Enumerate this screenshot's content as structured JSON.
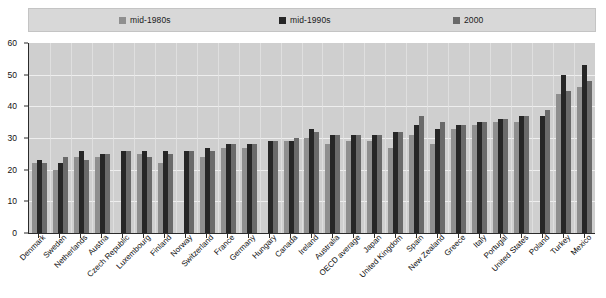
{
  "legend": {
    "items": [
      {
        "label": "mid-1980s",
        "color": "#8f8f8f",
        "icon": "square-swatch-icon"
      },
      {
        "label": "mid-1990s",
        "color": "#262626",
        "icon": "square-swatch-icon"
      },
      {
        "label": "2000",
        "color": "#6a6a6a",
        "icon": "square-swatch-icon"
      }
    ]
  },
  "chart_data": {
    "type": "bar",
    "title": "",
    "subtitle": "",
    "xlabel": "",
    "ylabel": "",
    "ylim": [
      0,
      60
    ],
    "yticks": [
      0,
      10,
      20,
      30,
      40,
      50,
      60
    ],
    "grid": true,
    "legend_position": "top",
    "categories": [
      "Denmark",
      "Sweden",
      "Netherlands",
      "Austria",
      "Czech Republic",
      "Luxembourg",
      "Finland",
      "Norway",
      "Switzerland",
      "France",
      "Germany",
      "Hungary",
      "Canada",
      "Ireland",
      "Australia",
      "OECD average",
      "Japan",
      "United Kingdom",
      "Spain",
      "New Zealand",
      "Greece",
      "Italy",
      "Portugal",
      "United States",
      "Poland",
      "Turkey",
      "Mexico"
    ],
    "series": [
      {
        "name": "mid-1980s",
        "color": "#8f8f8f",
        "values": [
          22,
          20,
          24,
          24,
          null,
          25,
          22,
          null,
          24,
          27,
          27,
          null,
          29,
          30,
          28,
          29,
          29,
          27,
          31,
          28,
          33,
          34,
          35,
          35,
          null,
          44,
          46
        ]
      },
      {
        "name": "mid-1990s",
        "color": "#262626",
        "values": [
          23,
          22,
          26,
          25,
          26,
          26,
          26,
          26,
          27,
          28,
          28,
          29,
          29,
          33,
          31,
          31,
          31,
          32,
          34,
          33,
          34,
          35,
          36,
          37,
          37,
          50,
          53
        ]
      },
      {
        "name": "2000",
        "color": "#6a6a6a",
        "values": [
          22,
          24,
          23,
          25,
          26,
          24,
          25,
          26,
          26,
          28,
          28,
          29,
          30,
          32,
          31,
          31,
          31,
          32,
          37,
          35,
          34,
          35,
          36,
          37,
          39,
          45,
          48
        ]
      }
    ]
  },
  "axes": {
    "y_tick_labels": [
      "0",
      "10",
      "20",
      "30",
      "40",
      "50",
      "60"
    ]
  },
  "footnote": {
    "text": ""
  }
}
